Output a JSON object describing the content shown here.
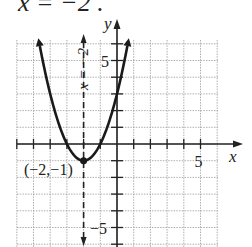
{
  "caption": "x = −2 .",
  "chart_data": {
    "type": "line",
    "title": "",
    "function": "y = (x + 2)^2 − 1",
    "xlabel": "x",
    "ylabel": "y",
    "xlim": [
      -6,
      6
    ],
    "ylim": [
      -6,
      6
    ],
    "grid": true,
    "x_tick_labels": [
      {
        "value": 5,
        "label": "5"
      }
    ],
    "y_tick_labels": [
      {
        "value": 5,
        "label": "5"
      },
      {
        "value": -5,
        "label": "−5"
      }
    ],
    "series": [
      {
        "name": "parabola",
        "x": [
          -4.7,
          -4,
          -3,
          -2,
          -1,
          0,
          0.7
        ],
        "y": [
          6.29,
          3,
          0,
          -1,
          0,
          3,
          6.29
        ]
      }
    ],
    "annotations": [
      {
        "type": "vertex",
        "point": [
          -2,
          -1
        ],
        "label": "(−2,−1)"
      },
      {
        "type": "axis_of_symmetry",
        "x": -2,
        "style": "dashed",
        "label": "x = −2"
      }
    ]
  }
}
